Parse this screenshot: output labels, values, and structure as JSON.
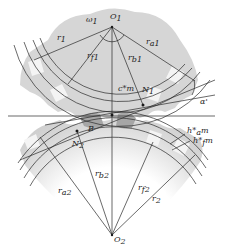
{
  "diagram": {
    "labels": {
      "o1": "O",
      "o1_sub": "1",
      "omega1": "ω",
      "omega1_sub": "1",
      "r1": "r",
      "r1_sub": "1",
      "rf1": "r",
      "rf1_sub": "f1",
      "rb1": "r",
      "rb1_sub": "b1",
      "ra1": "r",
      "ra1_sub": "a1",
      "n1": "N",
      "n1_sub": "1",
      "cm": "c*m",
      "alpha": "α'",
      "b": "B",
      "n2": "N",
      "n2_sub": "2",
      "ham": "h*",
      "ham_sub": "a",
      "ham_m": "m",
      "hfm": "h*",
      "hfm_sub": "f",
      "hfm_m": "m",
      "ra2": "r",
      "ra2_sub": "a2",
      "rb2": "r",
      "rb2_sub": "b2",
      "rf2": "r",
      "rf2_sub": "f2",
      "r2": "r",
      "r2_sub": "2",
      "o2": "O",
      "o2_sub": "2"
    },
    "colors": {
      "gear_fill": "#d4d4d4",
      "gear_dark": "#a8a8a8",
      "line": "#2a2a2a",
      "background": "#ffffff"
    }
  }
}
